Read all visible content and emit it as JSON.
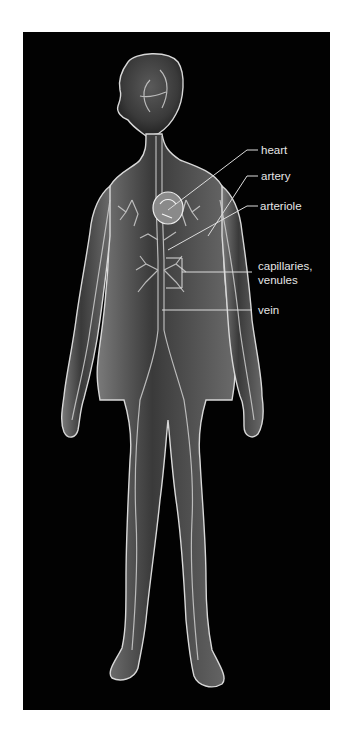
{
  "figure": {
    "background_color": "#020202",
    "labels": [
      {
        "id": "heart",
        "text": "heart"
      },
      {
        "id": "artery",
        "text": "artery"
      },
      {
        "id": "arteriole",
        "text": "arteriole"
      },
      {
        "id": "capillaries",
        "text": "capillaries,"
      },
      {
        "id": "venules",
        "text": "venules"
      },
      {
        "id": "vein",
        "text": "vein"
      }
    ]
  }
}
